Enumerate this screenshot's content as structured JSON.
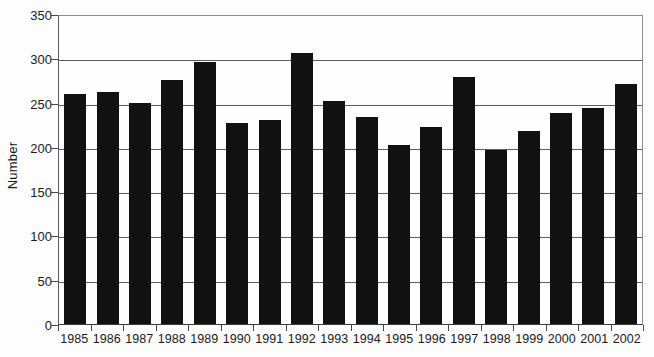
{
  "chart_data": {
    "type": "bar",
    "title": "",
    "xlabel": "",
    "ylabel": "Number",
    "ylim": [
      0,
      350
    ],
    "yticks": [
      0,
      50,
      100,
      150,
      200,
      250,
      300,
      350
    ],
    "grid": true,
    "legend": "none",
    "bar_color": "#111111",
    "gridline_color": "#5c5c5c",
    "categories": [
      "1985",
      "1986",
      "1987",
      "1988",
      "1989",
      "1990",
      "1991",
      "1992",
      "1993",
      "1994",
      "1995",
      "1996",
      "1997",
      "1998",
      "1999",
      "2000",
      "2001",
      "2002"
    ],
    "values": [
      260,
      262,
      249,
      276,
      296,
      227,
      230,
      306,
      252,
      234,
      202,
      223,
      279,
      197,
      218,
      238,
      244,
      271
    ]
  }
}
